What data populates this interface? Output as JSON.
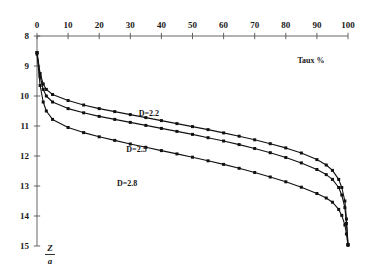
{
  "chart_data": {
    "type": "line",
    "title": "",
    "subtitle": "",
    "xlabel": "Taux %",
    "ylabel": "Z/a",
    "ylabel_numerator": "Z",
    "ylabel_denominator": "a",
    "xlim": [
      0,
      100
    ],
    "ylim": [
      8,
      15
    ],
    "y_axis_inverted": true,
    "grid": false,
    "legend_position": "inline-annotations",
    "x_ticks": [
      0,
      10,
      20,
      30,
      40,
      50,
      60,
      70,
      80,
      90,
      100
    ],
    "x_tick_labels": [
      "0",
      "10",
      "20",
      "30",
      "40",
      "50",
      "60",
      "70",
      "80",
      "90",
      "100"
    ],
    "y_ticks": [
      8,
      9,
      10,
      11,
      12,
      13,
      14,
      15
    ],
    "y_tick_labels": [
      "8",
      "9",
      "10",
      "11",
      "12",
      "13",
      "14",
      "15"
    ],
    "marker": "square",
    "line_color": "#111111",
    "axis_color": "#555555",
    "x": [
      0,
      1,
      2,
      3,
      5,
      10,
      15,
      20,
      25,
      30,
      35,
      40,
      45,
      50,
      55,
      60,
      65,
      70,
      75,
      80,
      85,
      90,
      93,
      95,
      97,
      98,
      99,
      99.5,
      100
    ],
    "series": [
      {
        "name": "D=2.2",
        "label": "D=2.2",
        "label_x": 36,
        "label_y": 10.65,
        "values": [
          8.55,
          9.25,
          9.6,
          9.78,
          9.95,
          10.15,
          10.3,
          10.42,
          10.52,
          10.62,
          10.72,
          10.82,
          10.92,
          11.02,
          11.12,
          11.23,
          11.34,
          11.46,
          11.59,
          11.73,
          11.9,
          12.12,
          12.3,
          12.48,
          12.78,
          13.05,
          13.5,
          14.1,
          14.95
        ]
      },
      {
        "name": "D=2.5",
        "label": "D=2.5",
        "label_x": 32,
        "label_y": 11.85,
        "values": [
          8.55,
          9.35,
          9.78,
          10.0,
          10.2,
          10.42,
          10.56,
          10.68,
          10.78,
          10.88,
          10.98,
          11.08,
          11.18,
          11.28,
          11.39,
          11.5,
          11.62,
          11.75,
          11.89,
          12.05,
          12.23,
          12.45,
          12.62,
          12.78,
          13.05,
          13.3,
          13.72,
          14.25,
          14.95
        ]
      },
      {
        "name": "D=2.8",
        "label": "D=2.8",
        "label_x": 29,
        "label_y": 13.0,
        "values": [
          8.6,
          9.65,
          10.2,
          10.5,
          10.78,
          11.05,
          11.22,
          11.36,
          11.48,
          11.6,
          11.71,
          11.82,
          11.93,
          12.04,
          12.16,
          12.28,
          12.41,
          12.55,
          12.7,
          12.86,
          13.04,
          13.25,
          13.4,
          13.54,
          13.78,
          13.98,
          14.3,
          14.6,
          14.98
        ]
      }
    ]
  }
}
